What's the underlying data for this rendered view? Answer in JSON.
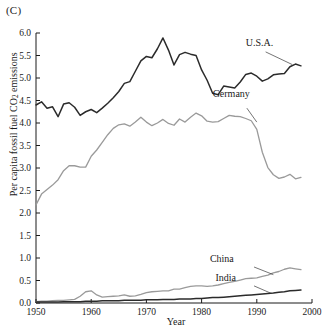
{
  "figure": {
    "panel_label": "(C)",
    "xlabel": "Year",
    "ylabel_prefix": "Per capita fossil fuel CO",
    "ylabel_sub": "2",
    "ylabel_suffix": " emissions"
  },
  "colors": {
    "dark_series": "#2b2b2b",
    "light_series": "#9a9a9a",
    "axis": "#1a1a1a",
    "background": "#ffffff"
  },
  "chart_data": {
    "type": "line",
    "title": "(C)",
    "xlabel": "Year",
    "ylabel": "Per capita fossil fuel CO2 emissions",
    "xlim": [
      1950,
      2000
    ],
    "ylim": [
      0.0,
      6.0
    ],
    "xticks": [
      1950,
      1960,
      1970,
      1980,
      1990,
      2000
    ],
    "yticks": [
      0.0,
      0.5,
      1.0,
      1.5,
      2.0,
      2.5,
      3.0,
      3.5,
      4.0,
      4.5,
      5.0,
      5.5,
      6.0
    ],
    "xtick_labels": [
      "1950",
      "1960",
      "1970",
      "1980",
      "1990",
      "2000"
    ],
    "ytick_labels": [
      "0.0",
      "0.5",
      "1.0",
      "1.5",
      "2.0",
      "2.5",
      "3.0",
      "3.5",
      "4.0",
      "4.5",
      "5.0",
      "5.5",
      "6.0"
    ],
    "grid": false,
    "legend": "inline-annotations",
    "series": [
      {
        "name": "U.S.A.",
        "color": "#2b2b2b",
        "width": 1.5,
        "label_x": 1988,
        "label_y": 5.72,
        "leader": [
          [
            1991.6,
            5.58
          ],
          [
            1996.4,
            5.3
          ]
        ],
        "x": [
          1950,
          1951,
          1952,
          1953,
          1954,
          1955,
          1956,
          1957,
          1958,
          1959,
          1960,
          1961,
          1962,
          1963,
          1964,
          1965,
          1966,
          1967,
          1968,
          1969,
          1970,
          1971,
          1972,
          1973,
          1974,
          1975,
          1976,
          1977,
          1978,
          1979,
          1980,
          1981,
          1982,
          1983,
          1984,
          1985,
          1986,
          1987,
          1988,
          1989,
          1990,
          1991,
          1992,
          1993,
          1994,
          1995,
          1996,
          1997,
          1998
        ],
        "y": [
          4.4,
          4.47,
          4.33,
          4.36,
          4.14,
          4.42,
          4.45,
          4.35,
          4.17,
          4.25,
          4.3,
          4.23,
          4.33,
          4.44,
          4.56,
          4.7,
          4.88,
          4.92,
          5.15,
          5.38,
          5.48,
          5.45,
          5.65,
          5.89,
          5.62,
          5.29,
          5.52,
          5.57,
          5.53,
          5.5,
          5.18,
          4.95,
          4.66,
          4.63,
          4.82,
          4.8,
          4.78,
          4.91,
          5.08,
          5.11,
          5.04,
          4.93,
          4.98,
          5.07,
          5.09,
          5.1,
          5.25,
          5.31,
          5.27
        ]
      },
      {
        "name": "Germany",
        "color": "#9a9a9a",
        "width": 1.3,
        "label_x": 1982,
        "label_y": 4.57,
        "leader": [
          [
            1988.2,
            4.33
          ],
          [
            1990.0,
            4.02
          ]
        ],
        "x": [
          1950,
          1951,
          1952,
          1953,
          1954,
          1955,
          1956,
          1957,
          1958,
          1959,
          1960,
          1961,
          1962,
          1963,
          1964,
          1965,
          1966,
          1967,
          1968,
          1969,
          1970,
          1971,
          1972,
          1973,
          1974,
          1975,
          1976,
          1977,
          1978,
          1979,
          1980,
          1981,
          1982,
          1983,
          1984,
          1985,
          1986,
          1987,
          1988,
          1989,
          1990,
          1991,
          1992,
          1993,
          1994,
          1995,
          1996,
          1997,
          1998
        ],
        "y": [
          2.18,
          2.42,
          2.52,
          2.62,
          2.74,
          2.94,
          3.05,
          3.05,
          3.02,
          3.02,
          3.26,
          3.4,
          3.57,
          3.74,
          3.88,
          3.96,
          3.98,
          3.93,
          4.02,
          4.13,
          4.02,
          3.94,
          4.0,
          4.08,
          3.99,
          3.95,
          4.09,
          4.02,
          4.13,
          4.22,
          4.16,
          4.04,
          4.02,
          4.03,
          4.1,
          4.17,
          4.15,
          4.14,
          4.1,
          4.05,
          3.86,
          3.35,
          3.01,
          2.85,
          2.77,
          2.8,
          2.86,
          2.76,
          2.79
        ]
      },
      {
        "name": "China",
        "color": "#9a9a9a",
        "width": 1.3,
        "label_x": 1981.5,
        "label_y": 0.92,
        "leader": [
          [
            1989.5,
            0.8
          ],
          [
            1993.0,
            0.63
          ]
        ],
        "x": [
          1950,
          1951,
          1952,
          1953,
          1954,
          1955,
          1956,
          1957,
          1958,
          1959,
          1960,
          1961,
          1962,
          1963,
          1964,
          1965,
          1966,
          1967,
          1968,
          1969,
          1970,
          1971,
          1972,
          1973,
          1974,
          1975,
          1976,
          1977,
          1978,
          1979,
          1980,
          1981,
          1982,
          1983,
          1984,
          1985,
          1986,
          1987,
          1988,
          1989,
          1990,
          1991,
          1992,
          1993,
          1994,
          1995,
          1996,
          1997,
          1998
        ],
        "y": [
          0.03,
          0.04,
          0.04,
          0.05,
          0.06,
          0.06,
          0.07,
          0.08,
          0.15,
          0.25,
          0.27,
          0.18,
          0.13,
          0.14,
          0.15,
          0.16,
          0.18,
          0.15,
          0.16,
          0.19,
          0.23,
          0.25,
          0.26,
          0.27,
          0.27,
          0.31,
          0.31,
          0.34,
          0.37,
          0.38,
          0.38,
          0.37,
          0.38,
          0.4,
          0.43,
          0.46,
          0.48,
          0.51,
          0.54,
          0.55,
          0.56,
          0.59,
          0.62,
          0.67,
          0.7,
          0.75,
          0.78,
          0.76,
          0.74
        ]
      },
      {
        "name": "India",
        "color": "#2b2b2b",
        "width": 1.5,
        "label_x": 1982.5,
        "label_y": 0.5,
        "leader": [
          [
            1989.5,
            0.38
          ],
          [
            1992.5,
            0.22
          ]
        ],
        "x": [
          1950,
          1951,
          1952,
          1953,
          1954,
          1955,
          1956,
          1957,
          1958,
          1959,
          1960,
          1961,
          1962,
          1963,
          1964,
          1965,
          1966,
          1967,
          1968,
          1969,
          1970,
          1971,
          1972,
          1973,
          1974,
          1975,
          1976,
          1977,
          1978,
          1979,
          1980,
          1981,
          1982,
          1983,
          1984,
          1985,
          1986,
          1987,
          1988,
          1989,
          1990,
          1991,
          1992,
          1993,
          1994,
          1995,
          1996,
          1997,
          1998
        ],
        "y": [
          0.02,
          0.02,
          0.02,
          0.02,
          0.02,
          0.03,
          0.03,
          0.03,
          0.03,
          0.04,
          0.04,
          0.04,
          0.05,
          0.05,
          0.05,
          0.05,
          0.06,
          0.06,
          0.06,
          0.06,
          0.07,
          0.07,
          0.07,
          0.08,
          0.08,
          0.08,
          0.09,
          0.09,
          0.09,
          0.1,
          0.1,
          0.11,
          0.12,
          0.12,
          0.13,
          0.14,
          0.15,
          0.16,
          0.17,
          0.18,
          0.19,
          0.2,
          0.21,
          0.22,
          0.24,
          0.25,
          0.27,
          0.28,
          0.29
        ]
      }
    ]
  }
}
